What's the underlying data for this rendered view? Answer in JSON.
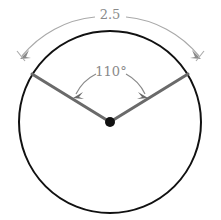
{
  "figure": {
    "background_color": "#ffffff",
    "circle": {
      "name": "circle-outline",
      "center_x": 110,
      "center_y": 122,
      "radius": 91,
      "stroke_color": "#111111",
      "stroke_width": 2
    },
    "center_point": {
      "name": "center-dot",
      "x": 110,
      "y": 122,
      "radius": 5,
      "color": "#111111"
    },
    "radii": {
      "stroke_color": "#6a6a6a",
      "stroke_width": 3,
      "left_end_x": 32,
      "left_end_y": 74,
      "right_end_x": 188,
      "right_end_y": 74
    },
    "angle_dimension": {
      "name": "angle-110",
      "label": "110°",
      "value": 110,
      "unit": "degrees",
      "label_x": 111,
      "label_y": 72,
      "arc_radius": 44,
      "color": "#8a8a8a",
      "stroke_width": 1.2
    },
    "arc_dimension": {
      "name": "arc-length-2p5",
      "label": "2.5",
      "value": 2.5,
      "label_x": 110,
      "label_y": 15,
      "arc_radius": 107,
      "color": "#a9a9a9",
      "stroke_width": 1.2
    },
    "colors": {
      "circle": "#111111",
      "radius_line": "#6a6a6a",
      "dimension_line": "#a0a0a0",
      "label_text": "#8a8a8a"
    }
  }
}
